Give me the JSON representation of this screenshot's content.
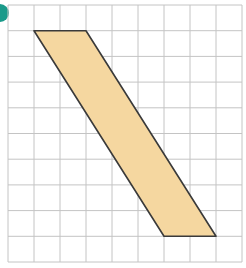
{
  "figure": {
    "marker_color": "#1a9a8a",
    "grid": {
      "left": 8,
      "top": 5,
      "cell_w": 26,
      "cell_h": 25.7,
      "cols": 9,
      "rows": 10,
      "line_color": "#c4c4c4"
    },
    "shape": {
      "type": "parallelogram",
      "fill": "#f5d7a0",
      "stroke": "#3a3a3a",
      "vertices_grid": [
        [
          1,
          1
        ],
        [
          3,
          1
        ],
        [
          8,
          9
        ],
        [
          6,
          9
        ]
      ]
    }
  }
}
